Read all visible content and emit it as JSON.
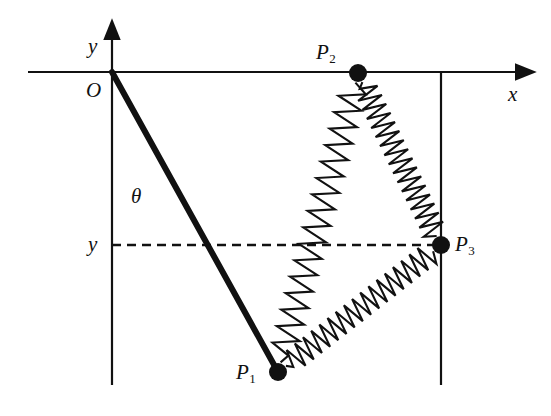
{
  "figure": {
    "kind": "physics-diagram",
    "background_color": "#ffffff",
    "ink_color": "#111111"
  },
  "axes": {
    "x_axis": {
      "label": "x",
      "label_at": {
        "x": 508,
        "y": 84
      },
      "line": {
        "x1": 28,
        "y1": 72,
        "x2": 517,
        "y2": 72
      },
      "arrow": "right"
    },
    "y_axis": {
      "label": "y",
      "label_at": {
        "x": 88,
        "y": 36
      },
      "line": {
        "x1": 112,
        "y1": 385,
        "x2": 112,
        "y2": 38
      },
      "arrow": "up"
    },
    "origin": {
      "label": "O",
      "label_at": {
        "x": 86,
        "y": 80
      },
      "point": {
        "x": 112,
        "y": 72
      }
    }
  },
  "guides": {
    "y_coordinate_label": "y",
    "y_coordinate_label_at": {
      "x": 88,
      "y": 234
    },
    "y_dashed_line": {
      "x1": 112,
      "y1": 245,
      "x2": 443,
      "y2": 245
    },
    "right_vertical_line": {
      "x1": 441,
      "y1": 72,
      "x2": 441,
      "y2": 385
    },
    "angle_label": "θ",
    "angle_label_at": {
      "x": 131,
      "y": 186
    },
    "angle_arc": {
      "cx": 112,
      "cy": 72,
      "r": 98,
      "start_deg": 270,
      "end_deg": 299
    }
  },
  "rod": {
    "name": "pendulum-rod",
    "from": {
      "x": 112,
      "y": 72
    },
    "to": {
      "x": 278,
      "y": 372
    },
    "stroke_width": 6
  },
  "points": [
    {
      "id": "P1",
      "label": "P",
      "subscript": "1",
      "x": 278,
      "y": 372,
      "radius": 9,
      "label_at": {
        "x": 236,
        "y": 362
      }
    },
    {
      "id": "P2",
      "label": "P",
      "subscript": "2",
      "x": 358,
      "y": 73,
      "radius": 9,
      "label_at": {
        "x": 316,
        "y": 42
      }
    },
    {
      "id": "P3",
      "label": "P",
      "subscript": "3",
      "x": 441,
      "y": 245,
      "radius": 9,
      "label_at": {
        "x": 455,
        "y": 234
      }
    }
  ],
  "springs": [
    {
      "id": "spring-P1-P2",
      "from": "P1",
      "to": "P2",
      "coils": 17,
      "amplitude": 13
    },
    {
      "id": "spring-P2-P3",
      "from": "P2",
      "to": "P3",
      "coils": 17,
      "amplitude": 12
    },
    {
      "id": "spring-P1-P3",
      "from": "P1",
      "to": "P3",
      "coils": 18,
      "amplitude": 12
    }
  ]
}
